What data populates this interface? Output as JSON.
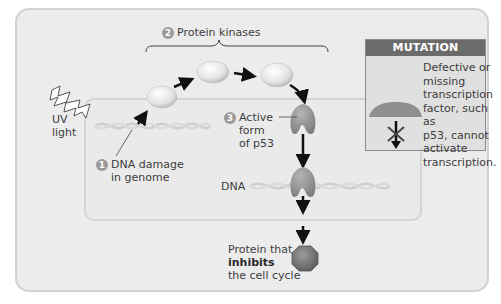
{
  "diagram": {
    "steps": [
      {
        "number": "1",
        "label_line1": "DNA damage",
        "label_line2": "in genome"
      },
      {
        "number": "2",
        "label": "Protein kinases"
      },
      {
        "number": "3",
        "label_line1": "Active",
        "label_line2": "form",
        "label_line3": "of p53"
      }
    ],
    "uv": {
      "line1": "UV",
      "line2": "light"
    },
    "dna_label": "DNA",
    "product": {
      "line1": "Protein that",
      "line2": "inhibits",
      "line3": "the cell cycle"
    },
    "mutation_box": {
      "header": "MUTATION",
      "lines": [
        "Defective or",
        "missing",
        "transcription",
        "factor, such as",
        "p53, cannot",
        "activate",
        "transcription."
      ]
    },
    "colors": {
      "background": "#ececec",
      "border": "#d2d2d2",
      "mutation_header": "#6b6b6b",
      "p53_protein": "#8f8f8f",
      "inhibitor": "#7a7a7a",
      "arrow": "#111111"
    }
  }
}
